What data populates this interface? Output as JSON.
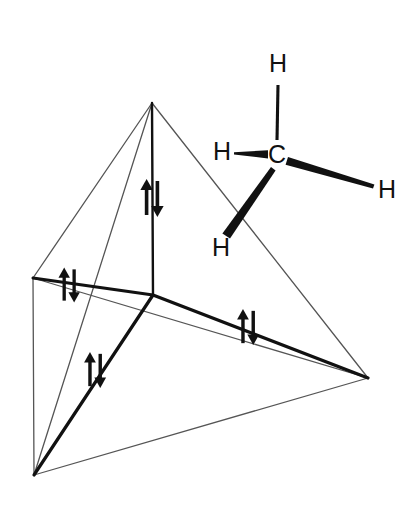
{
  "figure": {
    "background_color": "#ffffff",
    "ink_color": "#111111",
    "thin_edge_color": "#555555",
    "width": 415,
    "height": 512
  },
  "tetrahedron": {
    "description": "Tetrahedron showing four sp3 hybrid orbital directions from a central atom, each bearing an electron pair",
    "vertices": [
      {
        "name": "apex",
        "x": 152,
        "y": 103
      },
      {
        "name": "left",
        "x": 33,
        "y": 278
      },
      {
        "name": "bottom-left",
        "x": 34,
        "y": 475
      },
      {
        "name": "right",
        "x": 368,
        "y": 378
      }
    ],
    "center": {
      "name": "center",
      "x": 153,
      "y": 295
    },
    "bonds": [
      {
        "name": "bond-to-apex",
        "from": "center",
        "to": "apex"
      },
      {
        "name": "bond-to-left",
        "from": "center",
        "to": "left"
      },
      {
        "name": "bond-to-bottom-left",
        "from": "center",
        "to": "bottom-left"
      },
      {
        "name": "bond-to-right",
        "from": "center",
        "to": "right"
      }
    ],
    "edges": [
      {
        "name": "edge-apex-left",
        "from": "apex",
        "to": "left"
      },
      {
        "name": "edge-apex-bottom-left",
        "from": "apex",
        "to": "bottom-left"
      },
      {
        "name": "edge-apex-right",
        "from": "apex",
        "to": "right"
      },
      {
        "name": "edge-left-bottom-left",
        "from": "left",
        "to": "bottom-left"
      },
      {
        "name": "edge-left-right",
        "from": "left",
        "to": "right"
      },
      {
        "name": "edge-bottom-left-right",
        "from": "bottom-left",
        "to": "right"
      }
    ]
  },
  "electron_pairs": [
    {
      "name": "electron-pair-top",
      "x": 154,
      "y": 198,
      "rotation": 0
    },
    {
      "name": "electron-pair-left",
      "x": 71,
      "y": 285,
      "rotation": 0
    },
    {
      "name": "electron-pair-lower-left",
      "x": 97,
      "y": 370,
      "rotation": 0
    },
    {
      "name": "electron-pair-right",
      "x": 250,
      "y": 327,
      "rotation": 0
    }
  ],
  "methane": {
    "description": "Methane molecule drawn with wedge and line bonds",
    "carbon": {
      "label": "C",
      "x": 277,
      "y": 155
    },
    "hydrogens": [
      {
        "name": "hydrogen-top",
        "label": "H",
        "x": 278,
        "y": 65,
        "bond": "line"
      },
      {
        "name": "hydrogen-left",
        "label": "H",
        "x": 222,
        "y": 152,
        "bond": "wedge"
      },
      {
        "name": "hydrogen-right",
        "label": "H",
        "x": 387,
        "y": 190,
        "bond": "wedge"
      },
      {
        "name": "hydrogen-bottom",
        "label": "H",
        "x": 221,
        "y": 248,
        "bond": "wedge"
      }
    ]
  }
}
